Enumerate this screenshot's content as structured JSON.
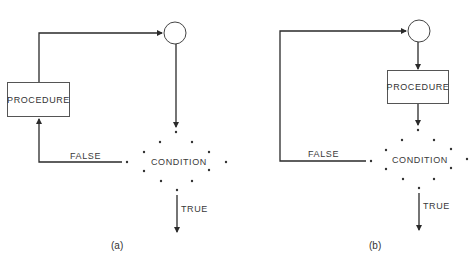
{
  "header_fragment": "",
  "diagrams": [
    {
      "id": "a",
      "caption": "(a)",
      "procedure_label": "PROCEDURE",
      "condition_label": "CONDITION",
      "false_label": "FALSE",
      "true_label": "TRUE",
      "description": "Procedure executed before condition test; FALSE loops back to procedure"
    },
    {
      "id": "b",
      "caption": "(b)",
      "procedure_label": "PROCEDURE",
      "condition_label": "CONDITION",
      "false_label": "FALSE",
      "true_label": "TRUE",
      "description": "Connector then procedure then condition; FALSE loops back to connector"
    }
  ],
  "colors": {
    "line": "#2a2a2a",
    "text": "#333333",
    "background": "#ffffff"
  }
}
